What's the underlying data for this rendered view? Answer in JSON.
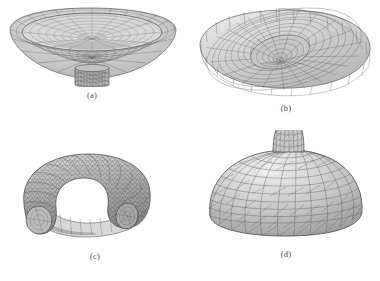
{
  "figure": {
    "kind": "wireframe-mesh-figure-panel",
    "background_color": "#ffffff",
    "mesh_color": "#5d5d5d",
    "mesh_fill": "#cfcfcf",
    "layout": "2x2",
    "top_artifact_text": "",
    "bottom_artifact_text": "",
    "panels": [
      {
        "id": "a",
        "label": "(a)",
        "shape": "shallow-bowl-with-stem",
        "description": "wide shallow dish-shaped surface mesh with a short cylindrical stem beneath the center"
      },
      {
        "id": "b",
        "label": "(b)",
        "shape": "flat-torus-bowl-with-funnel",
        "description": "flattened elliptical annular bowl mesh with a deep narrow funnel at the center"
      },
      {
        "id": "c",
        "label": "(c)",
        "shape": "bent-tube-partial-torus",
        "description": "thick curved tube mesh bent into a horseshoe, dense triangulated surface"
      },
      {
        "id": "d",
        "label": "(d)",
        "shape": "dome-with-neck",
        "description": "rounded dome mesh with a narrow cylindrical neck rising from the apex"
      }
    ]
  }
}
